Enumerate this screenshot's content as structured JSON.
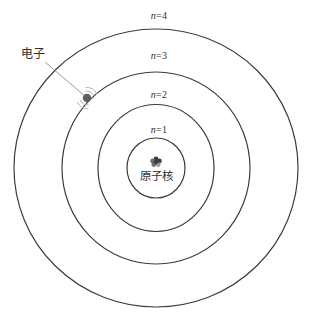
{
  "diagram": {
    "type": "bohr-atom-energy-levels",
    "orbits": [
      {
        "symbol": "n",
        "eq": "=1"
      },
      {
        "symbol": "n",
        "eq": "=2"
      },
      {
        "symbol": "n",
        "eq": "=3"
      },
      {
        "symbol": "n",
        "eq": "=4"
      }
    ],
    "labels": {
      "electron": "电子",
      "nucleus": "原子核"
    },
    "colors": {
      "background": "#ffffff",
      "orbit_stroke": "#3c3c3c",
      "leader_line": "#8f8f8f",
      "vibration_arc": "#b3b3b3",
      "electron_fill": "#5f5f5f",
      "electron_edge": "#3a3a3a",
      "text": "#2f2f2f",
      "nucleus_dark": "#3f3f3f",
      "nucleus_mid": "#6e6e6e",
      "nucleus_light": "#9a9a9a"
    }
  }
}
